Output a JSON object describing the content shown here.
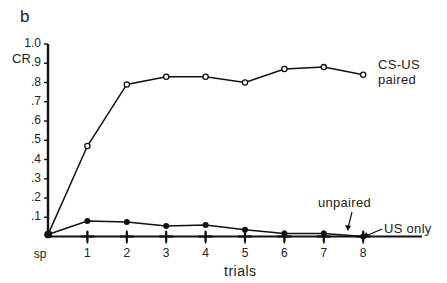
{
  "panel_label": "b",
  "chart_data": {
    "type": "line",
    "title": "",
    "xlabel": "trials",
    "ylabel": "CR",
    "categories": [
      "sp",
      "1",
      "2",
      "3",
      "4",
      "5",
      "6",
      "7",
      "8"
    ],
    "ylim": [
      0,
      1.0
    ],
    "yticks": [
      ".1",
      ".2",
      ".3",
      ".4",
      ".5",
      ".6",
      ".7",
      ".8",
      ".9",
      "1.0"
    ],
    "ytick_values": [
      0.1,
      0.2,
      0.3,
      0.4,
      0.5,
      0.6,
      0.7,
      0.8,
      0.9,
      1.0
    ],
    "grid": false,
    "legend_position": "inline labels at right",
    "series": [
      {
        "name": "CS-US paired",
        "label_lines": [
          "CS-US",
          "paired"
        ],
        "marker": "open-circle",
        "values": [
          0.01,
          0.47,
          0.79,
          0.83,
          0.83,
          0.8,
          0.87,
          0.88,
          0.84
        ]
      },
      {
        "name": "unpaired",
        "marker": "filled-circle",
        "values": [
          0.01,
          0.08,
          0.075,
          0.055,
          0.06,
          0.035,
          0.015,
          0.015,
          0.0
        ]
      },
      {
        "name": "US only",
        "marker": "plus",
        "values": [
          0.0,
          0.0,
          0.0,
          0.0,
          0.0,
          0.0,
          0.0,
          0.0,
          0.0
        ]
      }
    ]
  }
}
